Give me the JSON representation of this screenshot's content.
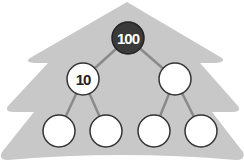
{
  "colors": {
    "background": "#ffffff",
    "tree_silhouette": "#c8c8c8",
    "edge": "#8a8a8a",
    "node_fill": "#ffffff",
    "node_stroke": "#333333",
    "root_fill": "#3a3a3a",
    "root_text": "#ffffff",
    "node_text": "#222222"
  },
  "tree": {
    "root": {
      "label": "100",
      "highlighted": true
    },
    "level1": [
      {
        "label": "10"
      },
      {
        "label": ""
      }
    ],
    "level2": [
      {
        "label": ""
      },
      {
        "label": ""
      },
      {
        "label": ""
      },
      {
        "label": ""
      }
    ]
  }
}
